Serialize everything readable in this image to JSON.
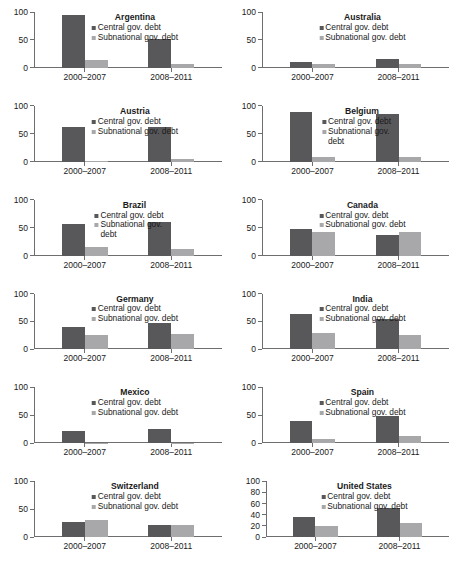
{
  "chart_data": {
    "type": "bar",
    "title": "",
    "xlabel": "",
    "ylabel": "",
    "layout": {
      "rows": 6,
      "cols": 2,
      "grid": false,
      "legend_position": "inside-top-center"
    },
    "categories": [
      "2000–2007",
      "2008–2011"
    ],
    "series_names": [
      "Central gov. debt",
      "Subnational gov. debt"
    ],
    "colors": {
      "central": "#58585a",
      "subnational": "#a8a8aa",
      "axis": "#6e6e70",
      "text": "#1a1a1a"
    },
    "default_yticks": [
      0,
      50,
      100
    ],
    "default_ylim": [
      0,
      100
    ],
    "panels": [
      {
        "name": "Argentina",
        "ylim": [
          0,
          100
        ],
        "yticks": [
          0,
          50,
          100
        ],
        "legend": [
          "Central gov. debt",
          "Subnational gov. debt"
        ],
        "legend_wrap": false,
        "series": [
          {
            "name": "Central gov. debt",
            "values": [
              95,
              52
            ]
          },
          {
            "name": "Subnational gov. debt",
            "values": [
              14,
              6
            ]
          }
        ]
      },
      {
        "name": "Australia",
        "ylim": [
          0,
          100
        ],
        "yticks": [
          0,
          50,
          100
        ],
        "legend": [
          "Central gov. debt",
          "Subnational gov. debt"
        ],
        "legend_wrap": false,
        "series": [
          {
            "name": "Central gov. debt",
            "values": [
              10,
              16
            ]
          },
          {
            "name": "Subnational gov. debt",
            "values": [
              6,
              6
            ]
          }
        ]
      },
      {
        "name": "Austria",
        "ylim": [
          0,
          100
        ],
        "yticks": [
          0,
          50,
          100
        ],
        "legend": [
          "Central gov. debt",
          "Subnational gov. debt"
        ],
        "legend_wrap": false,
        "series": [
          {
            "name": "Central gov. debt",
            "values": [
              62,
              62
            ]
          },
          {
            "name": "Subnational gov. debt",
            "values": [
              2,
              5
            ]
          }
        ]
      },
      {
        "name": "Belgium",
        "ylim": [
          0,
          100
        ],
        "yticks": [
          0,
          50,
          100
        ],
        "legend": [
          "Central gov. debt",
          "Subnational gov. debt"
        ],
        "legend_wrap": true,
        "series": [
          {
            "name": "Central gov. debt",
            "values": [
              89,
              86
            ]
          },
          {
            "name": "Subnational gov. debt",
            "values": [
              9,
              9
            ]
          }
        ]
      },
      {
        "name": "Brazil",
        "ylim": [
          0,
          100
        ],
        "yticks": [
          0,
          50,
          100
        ],
        "legend": [
          "Central gov. debt",
          "Subnational gov. debt"
        ],
        "legend_wrap": true,
        "series": [
          {
            "name": "Central gov. debt",
            "values": [
              57,
              60
            ]
          },
          {
            "name": "Subnational gov. debt",
            "values": [
              16,
              12
            ]
          }
        ]
      },
      {
        "name": "Canada",
        "ylim": [
          0,
          100
        ],
        "yticks": [
          0,
          50,
          100
        ],
        "legend": [
          "Central gov. debt",
          "Subnational gov. debt"
        ],
        "legend_wrap": false,
        "series": [
          {
            "name": "Central gov. debt",
            "values": [
              48,
              37
            ]
          },
          {
            "name": "Subnational gov. debt",
            "values": [
              43,
              42
            ]
          }
        ]
      },
      {
        "name": "Germany",
        "ylim": [
          0,
          100
        ],
        "yticks": [
          0,
          50,
          100
        ],
        "legend": [
          "Central gov. debt",
          "Subnational gov. debt"
        ],
        "legend_wrap": false,
        "series": [
          {
            "name": "Central gov. debt",
            "values": [
              40,
              47
            ]
          },
          {
            "name": "Subnational gov. debt",
            "values": [
              25,
              28
            ]
          }
        ]
      },
      {
        "name": "India",
        "ylim": [
          0,
          100
        ],
        "yticks": [
          0,
          50,
          100
        ],
        "legend": [
          "Central gov. debt",
          "Subnational gov. debt"
        ],
        "legend_wrap": false,
        "series": [
          {
            "name": "Central gov. debt",
            "values": [
              63,
              54
            ]
          },
          {
            "name": "Subnational gov. debt",
            "values": [
              30,
              26
            ]
          }
        ]
      },
      {
        "name": "Mexico",
        "ylim": [
          0,
          100
        ],
        "yticks": [
          0,
          50,
          100
        ],
        "legend": [
          "Central gov. debt",
          "Subnational gov. debt"
        ],
        "legend_wrap": false,
        "series": [
          {
            "name": "Central gov. debt",
            "values": [
              21,
              26
            ]
          },
          {
            "name": "Subnational gov. debt",
            "values": [
              1,
              1
            ]
          }
        ]
      },
      {
        "name": "Spain",
        "ylim": [
          0,
          100
        ],
        "yticks": [
          0,
          50,
          100
        ],
        "legend": [
          "Central gov. debt",
          "Subnational gov. debt"
        ],
        "legend_wrap": false,
        "series": [
          {
            "name": "Central gov. debt",
            "values": [
              40,
              48
            ]
          },
          {
            "name": "Subnational gov. debt",
            "values": [
              8,
              13
            ]
          }
        ]
      },
      {
        "name": "Switzerland",
        "ylim": [
          0,
          100
        ],
        "yticks": [
          0,
          50,
          100
        ],
        "legend": [
          "Central gov. debt",
          "Subnational gov. debt"
        ],
        "legend_wrap": false,
        "series": [
          {
            "name": "Central gov. debt",
            "values": [
              27,
              21
            ]
          },
          {
            "name": "Subnational gov. debt",
            "values": [
              30,
              22
            ]
          }
        ]
      },
      {
        "name": "United States",
        "ylim": [
          0,
          100
        ],
        "yticks": [
          0,
          20,
          40,
          60,
          80,
          100
        ],
        "legend": [
          "Central gov. debt",
          "Subnational gov. debt"
        ],
        "legend_wrap": false,
        "series": [
          {
            "name": "Central gov. debt",
            "values": [
              35,
              52
            ]
          },
          {
            "name": "Subnational gov. debt",
            "values": [
              20,
              25
            ]
          }
        ]
      }
    ]
  }
}
